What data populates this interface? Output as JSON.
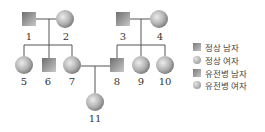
{
  "diagram": {
    "type": "pedigree",
    "colors": {
      "line": "#555555",
      "shape_dark": "#7a7a7a",
      "shape_light": "#d8d8d8"
    },
    "individuals": [
      {
        "id": "1",
        "sex": "male",
        "label": "1",
        "x": 29,
        "y": 19
      },
      {
        "id": "2",
        "sex": "female",
        "label": "2",
        "x": 65,
        "y": 19
      },
      {
        "id": "3",
        "sex": "male",
        "label": "3",
        "x": 123,
        "y": 19
      },
      {
        "id": "4",
        "sex": "female",
        "label": "4",
        "x": 159,
        "y": 19
      },
      {
        "id": "5",
        "sex": "female",
        "label": "5",
        "x": 24,
        "y": 65
      },
      {
        "id": "6",
        "sex": "male",
        "label": "6",
        "x": 49,
        "y": 65
      },
      {
        "id": "7",
        "sex": "female",
        "label": "7",
        "x": 72,
        "y": 65
      },
      {
        "id": "8",
        "sex": "male",
        "label": "8",
        "x": 117,
        "y": 65
      },
      {
        "id": "9",
        "sex": "female",
        "label": "9",
        "x": 141,
        "y": 65
      },
      {
        "id": "10",
        "sex": "female",
        "label": "10",
        "x": 165,
        "y": 65
      },
      {
        "id": "11",
        "sex": "female",
        "label": "11",
        "x": 95,
        "y": 102
      }
    ],
    "matings": [
      {
        "partners": [
          "1",
          "2"
        ],
        "children": [
          "5",
          "6",
          "7"
        ]
      },
      {
        "partners": [
          "3",
          "4"
        ],
        "children": [
          "8",
          "9",
          "10"
        ]
      },
      {
        "partners": [
          "7",
          "8"
        ],
        "children": [
          "11"
        ]
      }
    ]
  },
  "legend": {
    "items": [
      {
        "shape": "square",
        "label": "정상 남자"
      },
      {
        "shape": "circle",
        "label": "정상 여자"
      },
      {
        "shape": "square",
        "label": "유전병 남자"
      },
      {
        "shape": "circle",
        "label": "유전병 여자"
      }
    ]
  },
  "labels": {
    "n1": "1",
    "n2": "2",
    "n3": "3",
    "n4": "4",
    "n5": "5",
    "n6": "6",
    "n7": "7",
    "n8": "8",
    "n9": "9",
    "n10": "10",
    "n11": "11"
  }
}
